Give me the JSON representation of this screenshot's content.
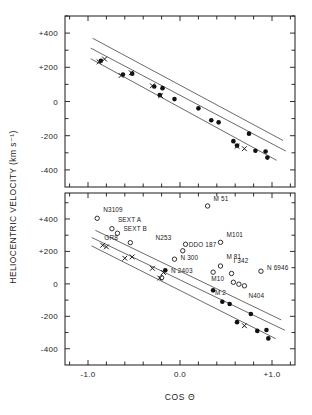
{
  "figure": {
    "ylabel": "HELIOCENTRIC  VELOCITY   (km s⁻¹)",
    "xlabel": "COS  Θ",
    "frame_color": "#1a1a1a",
    "open_marker_color": "#1a1a1a",
    "filled_marker_color": "#111111",
    "line_color": "#444444"
  },
  "chart_data": [
    {
      "type": "scatter",
      "panel": "top",
      "title": "",
      "xlabel": "",
      "ylabel": "HELIOCENTRIC VELOCITY (km s⁻¹)",
      "xlim": [
        -1.25,
        1.25
      ],
      "ylim": [
        -500,
        500
      ],
      "xticks": [
        -1.0,
        0.0,
        1.0
      ],
      "xticklabels": [
        "-1.0",
        "0.0",
        "+1.0"
      ],
      "yticks": [
        400,
        200,
        0,
        -200,
        -400
      ],
      "yticklabels": [
        "+400",
        "+200",
        "0",
        "-200",
        "-400"
      ],
      "grid": false,
      "legend": "none",
      "series": [
        {
          "name": "filled-circles",
          "marker": "filled-circle",
          "points": [
            {
              "x": -0.86,
              "y": 238
            },
            {
              "x": -0.62,
              "y": 158
            },
            {
              "x": -0.52,
              "y": 163
            },
            {
              "x": -0.28,
              "y": 88
            },
            {
              "x": -0.19,
              "y": 78
            },
            {
              "x": -0.22,
              "y": 38
            },
            {
              "x": -0.06,
              "y": 14
            },
            {
              "x": 0.2,
              "y": -40
            },
            {
              "x": 0.34,
              "y": -110
            },
            {
              "x": 0.42,
              "y": -122
            },
            {
              "x": 0.58,
              "y": -232
            },
            {
              "x": 0.62,
              "y": -258
            },
            {
              "x": 0.75,
              "y": -188
            },
            {
              "x": 0.82,
              "y": -288
            },
            {
              "x": 0.93,
              "y": -292
            },
            {
              "x": 0.95,
              "y": -328
            }
          ]
        },
        {
          "name": "crosses",
          "marker": "cross",
          "points": [
            {
              "x": -0.88,
              "y": 232
            },
            {
              "x": -0.82,
              "y": 248
            },
            {
              "x": -0.64,
              "y": 152
            },
            {
              "x": -0.53,
              "y": 168
            },
            {
              "x": -0.3,
              "y": 92
            },
            {
              "x": -0.21,
              "y": 34
            },
            {
              "x": 0.62,
              "y": -262
            },
            {
              "x": 0.7,
              "y": -276
            }
          ]
        }
      ],
      "fit_lines": [
        {
          "name": "upper-envelope",
          "x0": -0.95,
          "y0": 370,
          "x1": 1.12,
          "y1": -228
        },
        {
          "name": "central-fit",
          "x0": -0.97,
          "y0": 312,
          "x1": 1.15,
          "y1": -290
        },
        {
          "name": "lower-envelope",
          "x0": -0.97,
          "y0": 250,
          "x1": 1.05,
          "y1": -344
        }
      ]
    },
    {
      "type": "scatter",
      "panel": "bottom",
      "title": "",
      "xlabel": "COS Θ",
      "ylabel": "HELIOCENTRIC VELOCITY (km s⁻¹)",
      "xlim": [
        -1.25,
        1.25
      ],
      "ylim": [
        -500,
        560
      ],
      "xticks": [
        -1.0,
        0.0,
        1.0
      ],
      "xticklabels": [
        "-1.0",
        "0.0",
        "+1.0"
      ],
      "yticks": [
        400,
        200,
        0,
        -200,
        -400
      ],
      "yticklabels": [
        "+400",
        "+200",
        "0",
        "-200",
        "-400"
      ],
      "grid": false,
      "legend": "none",
      "series": [
        {
          "name": "named-galaxies-open-circles",
          "marker": "open-circle",
          "points": [
            {
              "x": -0.9,
              "y": 404,
              "label": "N3109",
              "label_dx": 6,
              "label_dy": -6
            },
            {
              "x": -0.74,
              "y": 340,
              "label": "SEXT A",
              "label_dx": 6,
              "label_dy": -7
            },
            {
              "x": -0.68,
              "y": 312,
              "label": "SEXT B",
              "label_dx": 6,
              "label_dy": -2
            },
            {
              "x": -0.54,
              "y": 254,
              "label": "GR8",
              "label_dx": -26,
              "label_dy": -3
            },
            {
              "x": 0.06,
              "y": 244,
              "label": "N253",
              "label_dx": -30,
              "label_dy": -4
            },
            {
              "x": 0.3,
              "y": 480,
              "label": "M 51",
              "label_dx": 6,
              "label_dy": -5
            },
            {
              "x": 0.44,
              "y": 256,
              "label": "M101",
              "label_dx": 6,
              "label_dy": -5
            },
            {
              "x": 0.03,
              "y": 204,
              "label": "DDO 187",
              "label_dx": 6,
              "label_dy": -4
            },
            {
              "x": -0.06,
              "y": 152,
              "label": "N 300",
              "label_dx": 6,
              "label_dy": 1
            },
            {
              "x": 0.36,
              "y": 72,
              "label": "N 2403",
              "label_dx": -42,
              "label_dy": 1
            },
            {
              "x": 0.44,
              "y": 110,
              "label": "M 81",
              "label_dx": 6,
              "label_dy": -7
            },
            {
              "x": 0.56,
              "y": 64,
              "label": "I 342",
              "label_dx": 2,
              "label_dy": -10
            },
            {
              "x": 0.58,
              "y": 10,
              "label": "M10",
              "label_dx": -22,
              "label_dy": -1
            },
            {
              "x": 0.64,
              "y": -2,
              "label": "M 2",
              "label_dx": -24,
              "label_dy": 11
            },
            {
              "x": 0.7,
              "y": -12,
              "label": "N404",
              "label_dx": 4,
              "label_dy": 12
            },
            {
              "x": 0.88,
              "y": 78,
              "label": "N 6946",
              "label_dx": 6,
              "label_dy": -1
            },
            {
              "x": -0.2,
              "y": 38,
              "label": "",
              "label_dx": 0,
              "label_dy": 0
            }
          ]
        },
        {
          "name": "filled-circles",
          "marker": "filled-circle",
          "points": [
            {
              "x": -0.16,
              "y": 84
            },
            {
              "x": 0.36,
              "y": -40
            },
            {
              "x": 0.46,
              "y": -110
            },
            {
              "x": 0.54,
              "y": -124
            },
            {
              "x": 0.62,
              "y": -236
            },
            {
              "x": 0.77,
              "y": -186
            },
            {
              "x": 0.84,
              "y": -290
            },
            {
              "x": 0.94,
              "y": -284
            },
            {
              "x": 0.96,
              "y": -336
            }
          ]
        },
        {
          "name": "crosses",
          "marker": "cross",
          "points": [
            {
              "x": -0.84,
              "y": 238
            },
            {
              "x": -0.8,
              "y": 228
            },
            {
              "x": -0.6,
              "y": 158
            },
            {
              "x": -0.52,
              "y": 166
            },
            {
              "x": -0.3,
              "y": 96
            },
            {
              "x": -0.22,
              "y": 36
            },
            {
              "x": -0.18,
              "y": 70
            },
            {
              "x": 0.7,
              "y": -258
            }
          ]
        }
      ],
      "fit_lines": [
        {
          "name": "upper-envelope",
          "x0": -0.92,
          "y0": 330,
          "x1": 1.1,
          "y1": -222
        },
        {
          "name": "central-fit",
          "x0": -0.96,
          "y0": 286,
          "x1": 1.14,
          "y1": -286
        },
        {
          "name": "lower-envelope",
          "x0": -0.96,
          "y0": 234,
          "x1": 1.04,
          "y1": -338
        }
      ]
    }
  ]
}
